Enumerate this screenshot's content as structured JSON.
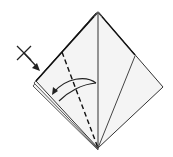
{
  "diagram": {
    "paper_fill": "#f4f4f4",
    "line_color": "#222222",
    "symbols": {
      "x_mark": "x-mark-icon",
      "push_arrow": "arrow-down-right-icon",
      "fold_arrow": "curved-fold-arrow-icon",
      "valley_fold": "dashed-valley-fold-line"
    }
  }
}
